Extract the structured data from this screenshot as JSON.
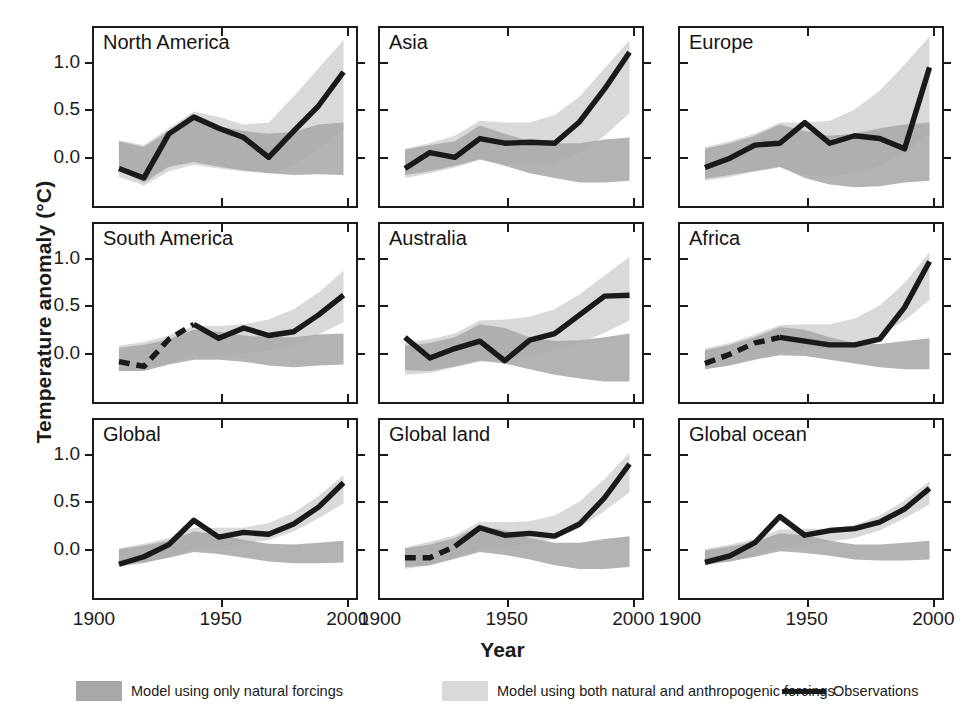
{
  "figure": {
    "ylabel": "Temperature anomaly (°C)",
    "xlabel": "Year"
  },
  "axis": {
    "ytick_labels": [
      "1.0",
      "0.5",
      "0.0"
    ],
    "ytick_values": [
      1.0,
      0.5,
      0.0
    ],
    "xtick_labels": [
      "1900",
      "1950",
      "2000"
    ],
    "xtick_values": [
      1900,
      1950,
      2000
    ],
    "xlim": [
      1900,
      2005
    ],
    "ylim": [
      -0.55,
      1.35
    ]
  },
  "legend": {
    "items": [
      {
        "label": "Model using only natural forcings",
        "type": "band",
        "color": "#a8a8a8"
      },
      {
        "label": "Model using both natural and anthropogenic forcings",
        "type": "band",
        "color": "#d9d9d9"
      },
      {
        "label": "Observations",
        "type": "line",
        "color": "#1a1a1a"
      }
    ]
  },
  "colors": {
    "natural_band": "#a8a8a8",
    "anthro_band": "#d9d9d9",
    "overlap_band": "#9a9a9a",
    "observations": "#1a1a1a",
    "axis": "#1a1a1a",
    "background": "#ffffff"
  },
  "chart_data": {
    "type": "line",
    "title": "",
    "xlabel": "Year",
    "ylabel": "Temperature anomaly (°C)",
    "xlim": [
      1900,
      2005
    ],
    "ylim": [
      -0.55,
      1.35
    ],
    "xticks": [
      1900,
      1950,
      2000
    ],
    "yticks": [
      0.0,
      0.5,
      1.0
    ],
    "grid": false,
    "legend_position": "bottom",
    "shared_x": [
      1910,
      1920,
      1930,
      1940,
      1950,
      1960,
      1970,
      1980,
      1990,
      2000
    ],
    "series_names": [
      "Model using only natural forcings",
      "Model using both natural and anthropogenic forcings",
      "Observations"
    ],
    "panels": [
      {
        "name": "North America",
        "row": 0,
        "col": 0,
        "observations": [
          -0.15,
          -0.25,
          0.22,
          0.4,
          0.28,
          0.18,
          -0.03,
          0.25,
          0.52,
          0.88
        ],
        "observations_dashed_until": null,
        "natural_lower": [
          -0.17,
          -0.3,
          -0.13,
          -0.08,
          -0.13,
          -0.17,
          -0.2,
          -0.22,
          -0.21,
          -0.22
        ],
        "natural_upper": [
          0.14,
          0.08,
          0.25,
          0.38,
          0.3,
          0.25,
          0.22,
          0.24,
          0.32,
          0.34
        ],
        "anthro_lower": [
          -0.24,
          -0.33,
          -0.18,
          -0.11,
          -0.15,
          -0.18,
          -0.2,
          -0.12,
          0.06,
          0.26
        ],
        "anthro_upper": [
          0.15,
          0.1,
          0.28,
          0.46,
          0.4,
          0.32,
          0.34,
          0.62,
          0.92,
          1.22
        ]
      },
      {
        "name": "Asia",
        "row": 0,
        "col": 1,
        "observations": [
          -0.15,
          0.02,
          -0.03,
          0.17,
          0.12,
          0.13,
          0.12,
          0.35,
          0.7,
          1.09
        ],
        "observations_dashed_until": null,
        "natural_lower": [
          -0.22,
          -0.18,
          -0.12,
          -0.05,
          -0.12,
          -0.2,
          -0.25,
          -0.3,
          -0.3,
          -0.28
        ],
        "natural_upper": [
          0.05,
          0.1,
          0.14,
          0.31,
          0.22,
          0.14,
          0.12,
          0.12,
          0.16,
          0.18
        ],
        "anthro_lower": [
          -0.25,
          -0.2,
          -0.14,
          -0.06,
          -0.1,
          -0.12,
          -0.1,
          0.02,
          0.2,
          0.44
        ],
        "anthro_upper": [
          0.06,
          0.12,
          0.2,
          0.36,
          0.34,
          0.34,
          0.42,
          0.62,
          0.92,
          1.22
        ]
      },
      {
        "name": "Europe",
        "row": 0,
        "col": 2,
        "observations": [
          -0.14,
          -0.04,
          0.1,
          0.12,
          0.34,
          0.12,
          0.2,
          0.17,
          0.06,
          0.93
        ],
        "observations_dashed_until": null,
        "natural_lower": [
          -0.26,
          -0.22,
          -0.18,
          -0.13,
          -0.25,
          -0.32,
          -0.35,
          -0.34,
          -0.3,
          -0.28
        ],
        "natural_upper": [
          0.06,
          0.12,
          0.2,
          0.32,
          0.25,
          0.2,
          0.22,
          0.28,
          0.32,
          0.34
        ],
        "anthro_lower": [
          -0.28,
          -0.24,
          -0.18,
          -0.14,
          -0.22,
          -0.24,
          -0.2,
          -0.12,
          0.02,
          0.22
        ],
        "anthro_upper": [
          0.08,
          0.14,
          0.22,
          0.34,
          0.34,
          0.36,
          0.48,
          0.68,
          0.96,
          1.26
        ]
      },
      {
        "name": "South America",
        "row": 1,
        "col": 0,
        "observations": [
          -0.12,
          -0.17,
          0.12,
          0.28,
          0.13,
          0.24,
          0.16,
          0.2,
          0.38,
          0.59
        ],
        "observations_dashed_until": 1930,
        "natural_lower": [
          -0.22,
          -0.22,
          -0.15,
          -0.1,
          -0.1,
          -0.12,
          -0.16,
          -0.18,
          -0.16,
          -0.15
        ],
        "natural_upper": [
          0.03,
          0.06,
          0.12,
          0.22,
          0.2,
          0.16,
          0.14,
          0.14,
          0.17,
          0.18
        ],
        "anthro_lower": [
          -0.22,
          -0.2,
          -0.13,
          -0.07,
          -0.05,
          -0.03,
          0.0,
          0.06,
          0.17,
          0.3
        ],
        "anthro_upper": [
          0.05,
          0.09,
          0.16,
          0.26,
          0.26,
          0.28,
          0.33,
          0.44,
          0.62,
          0.85
        ]
      },
      {
        "name": "Australia",
        "row": 1,
        "col": 1,
        "observations": [
          0.14,
          -0.08,
          0.02,
          0.1,
          -0.11,
          0.11,
          0.18,
          0.38,
          0.58,
          0.59
        ],
        "observations_dashed_until": null,
        "natural_lower": [
          -0.21,
          -0.22,
          -0.17,
          -0.11,
          -0.14,
          -0.2,
          -0.26,
          -0.3,
          -0.33,
          -0.33
        ],
        "natural_upper": [
          0.05,
          0.08,
          0.14,
          0.28,
          0.24,
          0.14,
          0.1,
          0.11,
          0.14,
          0.18
        ],
        "anthro_lower": [
          -0.26,
          -0.24,
          -0.18,
          -0.12,
          -0.1,
          -0.06,
          0.0,
          0.08,
          0.19,
          0.32
        ],
        "anthro_upper": [
          0.08,
          0.12,
          0.18,
          0.32,
          0.33,
          0.36,
          0.44,
          0.6,
          0.8,
          1.0
        ]
      },
      {
        "name": "Africa",
        "row": 1,
        "col": 2,
        "observations": [
          -0.14,
          -0.04,
          0.08,
          0.14,
          0.1,
          0.06,
          0.06,
          0.12,
          0.46,
          0.95
        ],
        "observations_dashed_until": 1935,
        "natural_lower": [
          -0.2,
          -0.16,
          -0.1,
          -0.05,
          -0.06,
          -0.1,
          -0.14,
          -0.18,
          -0.2,
          -0.2
        ],
        "natural_upper": [
          0.0,
          0.06,
          0.14,
          0.25,
          0.22,
          0.14,
          0.08,
          0.07,
          0.1,
          0.13
        ],
        "anthro_lower": [
          -0.2,
          -0.15,
          -0.08,
          -0.02,
          0.0,
          0.02,
          0.06,
          0.16,
          0.32,
          0.54
        ],
        "anthro_upper": [
          0.02,
          0.08,
          0.17,
          0.27,
          0.28,
          0.28,
          0.34,
          0.48,
          0.72,
          1.05
        ]
      },
      {
        "name": "Global",
        "row": 2,
        "col": 0,
        "observations": [
          -0.19,
          -0.11,
          0.02,
          0.28,
          0.1,
          0.15,
          0.13,
          0.24,
          0.42,
          0.68
        ],
        "observations_dashed_until": null,
        "natural_lower": [
          -0.2,
          -0.17,
          -0.12,
          -0.06,
          -0.08,
          -0.12,
          -0.16,
          -0.18,
          -0.18,
          -0.17
        ],
        "natural_upper": [
          -0.03,
          0.01,
          0.06,
          0.16,
          0.13,
          0.07,
          0.03,
          0.02,
          0.04,
          0.06
        ],
        "anthro_lower": [
          -0.22,
          -0.18,
          -0.11,
          -0.03,
          0.0,
          0.03,
          0.07,
          0.16,
          0.3,
          0.46
        ],
        "anthro_upper": [
          -0.02,
          0.03,
          0.09,
          0.2,
          0.2,
          0.2,
          0.25,
          0.36,
          0.54,
          0.76
        ]
      },
      {
        "name": "Global land",
        "row": 2,
        "col": 1,
        "observations": [
          -0.12,
          -0.12,
          0.0,
          0.2,
          0.12,
          0.14,
          0.11,
          0.24,
          0.52,
          0.88
        ],
        "observations_dashed_until": 1928,
        "natural_lower": [
          -0.22,
          -0.2,
          -0.13,
          -0.06,
          -0.09,
          -0.14,
          -0.2,
          -0.24,
          -0.24,
          -0.22
        ],
        "natural_upper": [
          -0.02,
          0.02,
          0.09,
          0.22,
          0.17,
          0.09,
          0.04,
          0.04,
          0.08,
          0.11
        ],
        "anthro_lower": [
          -0.24,
          -0.2,
          -0.12,
          -0.03,
          0.0,
          0.03,
          0.08,
          0.2,
          0.38,
          0.58
        ],
        "anthro_upper": [
          -0.01,
          0.05,
          0.12,
          0.26,
          0.26,
          0.27,
          0.33,
          0.48,
          0.72,
          1.0
        ]
      },
      {
        "name": "Global ocean",
        "row": 2,
        "col": 2,
        "observations": [
          -0.17,
          -0.1,
          0.04,
          0.32,
          0.12,
          0.17,
          0.19,
          0.26,
          0.4,
          0.62
        ],
        "observations_dashed_until": null,
        "natural_lower": [
          -0.19,
          -0.16,
          -0.11,
          -0.05,
          -0.07,
          -0.1,
          -0.14,
          -0.15,
          -0.15,
          -0.14
        ],
        "natural_upper": [
          -0.04,
          0.0,
          0.05,
          0.14,
          0.12,
          0.06,
          0.02,
          0.02,
          0.04,
          0.06
        ],
        "anthro_lower": [
          -0.2,
          -0.16,
          -0.1,
          -0.02,
          0.02,
          0.05,
          0.09,
          0.17,
          0.3,
          0.45
        ],
        "anthro_upper": [
          -0.03,
          0.02,
          0.08,
          0.18,
          0.19,
          0.19,
          0.23,
          0.33,
          0.49,
          0.7
        ]
      }
    ]
  }
}
